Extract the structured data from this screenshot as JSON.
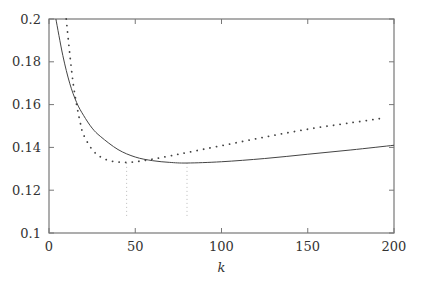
{
  "chart_data": {
    "type": "line",
    "title": "",
    "xlabel": "k",
    "ylabel": "",
    "xlim": [
      0,
      200
    ],
    "ylim": [
      0.1,
      0.2
    ],
    "xticks": [
      0,
      50,
      100,
      150,
      200
    ],
    "yticks": [
      0.1,
      0.12,
      0.14,
      0.16,
      0.18,
      0.2
    ],
    "xtick_labels": [
      "0",
      "50",
      "100",
      "150",
      "200"
    ],
    "ytick_labels": [
      "0.1",
      "0.12",
      "0.14",
      "0.16",
      "0.18",
      "0.2"
    ],
    "grid": false,
    "legend": null,
    "series": [
      {
        "name": "solid",
        "style": "solid",
        "x": [
          4,
          8,
          12,
          16,
          20,
          25,
          30,
          40,
          50,
          60,
          70,
          80,
          100,
          125,
          150,
          175,
          200
        ],
        "y": [
          0.2,
          0.183,
          0.17,
          0.161,
          0.155,
          0.149,
          0.145,
          0.139,
          0.1355,
          0.1338,
          0.133,
          0.1327,
          0.1333,
          0.1348,
          0.1368,
          0.1388,
          0.141
        ]
      },
      {
        "name": "dotted",
        "style": "dotted",
        "x": [
          10,
          12,
          14,
          16,
          18,
          20,
          25,
          30,
          35,
          40,
          45,
          50,
          60,
          70,
          80,
          100,
          125,
          150,
          175,
          195
        ],
        "y": [
          0.2,
          0.184,
          0.17,
          0.16,
          0.152,
          0.146,
          0.139,
          0.1355,
          0.1338,
          0.1332,
          0.133,
          0.1333,
          0.1345,
          0.136,
          0.1376,
          0.1408,
          0.1448,
          0.1485,
          0.1515,
          0.1538
        ]
      }
    ],
    "annotations": [
      {
        "type": "vertical-dotted-line",
        "x": 45,
        "y_from": 0.108,
        "y_to": 0.133,
        "label": "dotted-curve minimum"
      },
      {
        "type": "vertical-dotted-line",
        "x": 80,
        "y_from": 0.108,
        "y_to": 0.1327,
        "label": "solid-curve minimum"
      }
    ]
  }
}
